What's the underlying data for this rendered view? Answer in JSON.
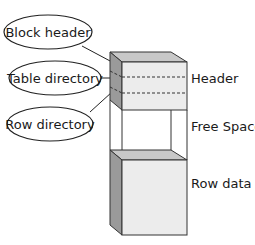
{
  "diagram": {
    "callouts": [
      {
        "label": "Block header"
      },
      {
        "label": "Table directory"
      },
      {
        "label": "Row directory"
      }
    ],
    "sections": [
      {
        "label": "Header"
      },
      {
        "label": "Free Space"
      },
      {
        "label": "Row data"
      }
    ]
  },
  "colors": {
    "front_face": "#ececec",
    "side_face": "#9a9a9a",
    "top_face": "#c8c8c8",
    "outline": "#333333",
    "background": "#ffffff"
  }
}
